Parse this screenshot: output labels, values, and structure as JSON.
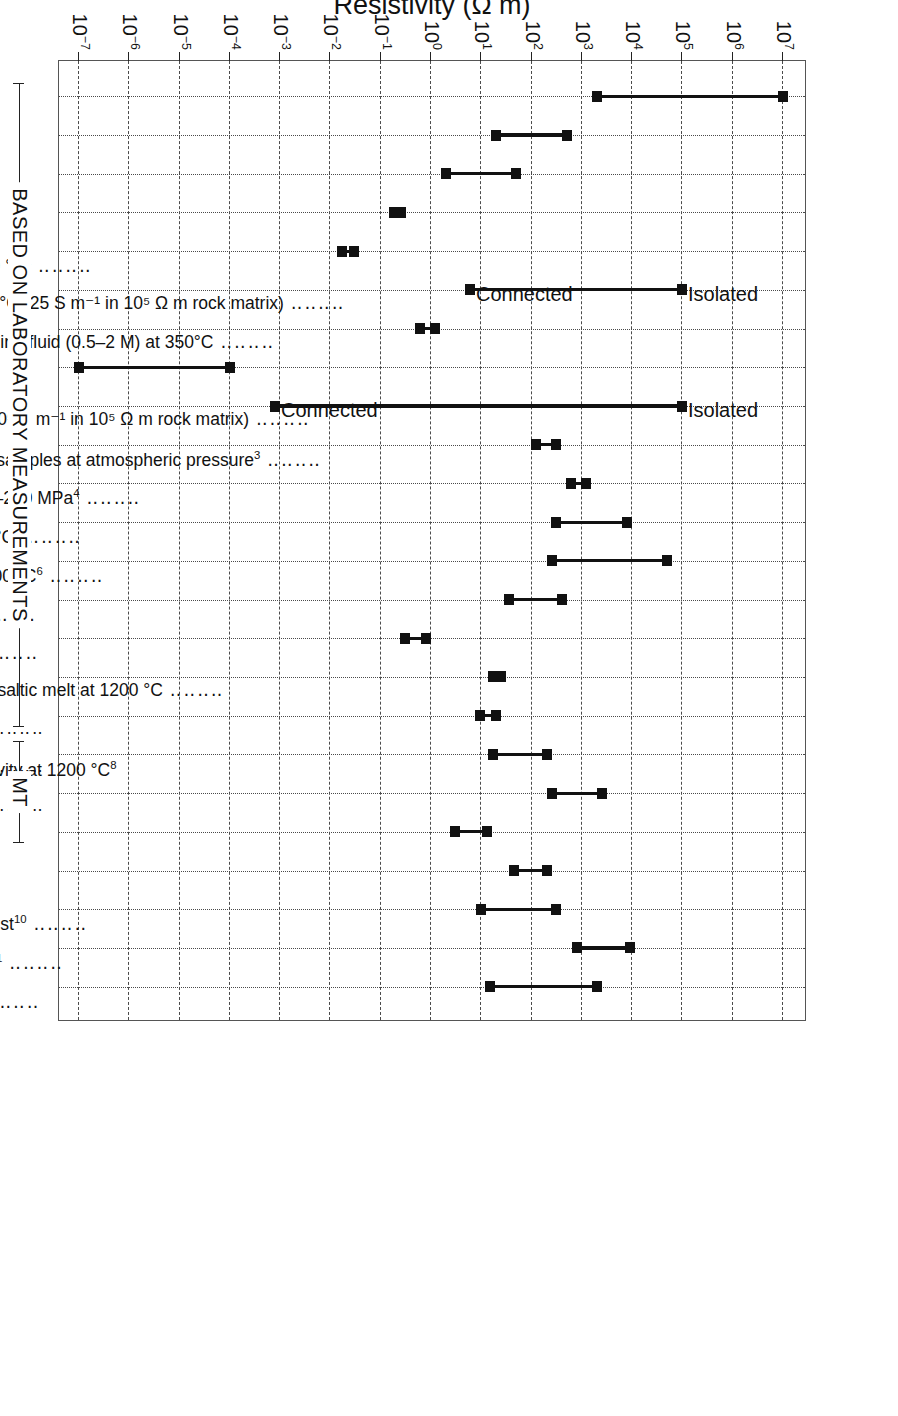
{
  "figure": {
    "axis_title": "Resistivity (Ω m)",
    "groups": [
      {
        "label": "BASED ON LABORATORY MEASUREMENTS",
        "from_index": 0,
        "to_index": 16
      },
      {
        "label": "MT",
        "from_index": 17,
        "to_index": 19
      }
    ],
    "bracket_label": "Hydrogen diffusivity at 1200 °C",
    "bracket_sup": "8",
    "bracket_children": [
      "olivine [100]",
      "olivine [010]",
      "olivine [001]"
    ]
  },
  "chart_data": {
    "type": "bar",
    "title": "",
    "xlabel": "",
    "ylabel": "Resistivity (Ω m)",
    "scale": "log10",
    "ylim": [
      1e-07,
      10000000.0
    ],
    "grid": true,
    "legend": "none",
    "tick_labels": [
      {
        "text": "10",
        "sup": "7",
        "value": 10000000.0
      },
      {
        "text": "10",
        "sup": "6",
        "value": 1000000.0
      },
      {
        "text": "10",
        "sup": "5",
        "value": 100000.0
      },
      {
        "text": "10",
        "sup": "4",
        "value": 10000.0
      },
      {
        "text": "10",
        "sup": "3",
        "value": 1000.0
      },
      {
        "text": "10",
        "sup": "2",
        "value": 100.0
      },
      {
        "text": "10",
        "sup": "1",
        "value": 10.0
      },
      {
        "text": "10",
        "sup": "0",
        "value": 1
      },
      {
        "text": "10",
        "sup": "−1",
        "value": 0.1
      },
      {
        "text": "10",
        "sup": "−2",
        "value": 0.01
      },
      {
        "text": "10",
        "sup": "−3",
        "value": 0.001
      },
      {
        "text": "10",
        "sup": "−4",
        "value": 0.0001
      },
      {
        "text": "10",
        "sup": "−5",
        "value": 1e-05
      },
      {
        "text": "10",
        "sup": "−6",
        "value": 1e-06
      },
      {
        "text": "10",
        "sup": "−7",
        "value": 1e-07
      }
    ],
    "categories": [
      {
        "label": "Dry igneous rocks",
        "sup": "",
        "low": 2000.0,
        "high": 10000000.0
      },
      {
        "label": "Old sediments",
        "sup": "",
        "low": 20.0,
        "high": 500.0
      },
      {
        "label": "Young sediments",
        "sup": "",
        "low": 2.0,
        "high": 50.0
      },
      {
        "label": "Seawater",
        "sup": "",
        "low": 0.18,
        "high": 0.25
      },
      {
        "label": "0.5–2 M saline fluid at 350 °C",
        "sup": "1",
        "low": 0.017,
        "high": 0.03
      },
      {
        "label": "1 vol.% saline fluid at 350 °C (25 S m⁻¹ in 10⁵ Ω m rock matrix)",
        "sup": "",
        "low": 6.0,
        "high": 100000.0
      },
      {
        "label": "5 vol.% interconnected saline fluid (0.5–2 M) at 350°C",
        "sup": "",
        "low": 0.6,
        "high": 1.2
      },
      {
        "label": "Graphite",
        "sup": "2",
        "low": 1e-07,
        "high": 0.0001
      },
      {
        "label": "1 vol.% graphite film(2 x 10⁵ S m⁻¹ in 10⁵ Ω m rock matrix)",
        "sup": "",
        "low": 0.0008,
        "high": 100000.0
      },
      {
        "label": "NaCl-saturated KTB core samples at atmospheric pressure",
        "sup": "3",
        "low": 120.0,
        "high": 300.0
      },
      {
        "label": "Serpentinized rocks at 50–250 MPa",
        "sup": "4",
        "low": 600.0,
        "high": 1200.0
      },
      {
        "label": "Dry olivine at 1000–1200 °C",
        "sup": "5",
        "low": 300.0,
        "high": 8000.0
      },
      {
        "label": "Dry pyroxene at 1000–1200 °C",
        "sup": "6",
        "low": 250.0,
        "high": 50000.0
      },
      {
        "label": "Wet olivine at 1200 °C",
        "sup": "7",
        "low": 35.0,
        "high": 400.0
      },
      {
        "label": "Partial melt at 1200 °C",
        "sup": "5",
        "low": 0.3,
        "high": 0.8
      },
      {
        "label": "5 vol.% interconnected basaltic melt at 1200 °C",
        "sup": "",
        "low": 17.0,
        "high": 25.0
      },
      {
        "label": "olivine [100]",
        "sup": "",
        "low": 9.5,
        "high": 20.0
      },
      {
        "label": "olivine [010]",
        "sup": "",
        "low": 17.0,
        "high": 200.0
      },
      {
        "label": "olivine [001]",
        "sup": "",
        "low": 250.0,
        "high": 2500.0
      },
      {
        "label": "Wadsleyite",
        "sup": "9",
        "low": 3.0,
        "high": 13.0
      },
      {
        "label": "Ilmenite + garnet",
        "sup": "6",
        "low": 45.0,
        "high": 200.0
      },
      {
        "label": "Mid–Lower continental crust",
        "sup": "10",
        "low": 10.0,
        "high": 300.0
      },
      {
        "label": "Upper continental mantle",
        "sup": "11",
        "low": 800.0,
        "high": 9000.0
      },
      {
        "label": "Upper oceanic mantle",
        "sup": "12",
        "low": 15.0,
        "high": 2000.0
      }
    ],
    "annotations": [
      {
        "text": "Isolated",
        "category_index": 5,
        "value": 100000.0
      },
      {
        "text": "Connected",
        "category_index": 5,
        "value": 6.0
      },
      {
        "text": "Isolated",
        "category_index": 8,
        "value": 100000.0
      },
      {
        "text": "Connected",
        "category_index": 8,
        "value": 0.0008
      }
    ]
  }
}
